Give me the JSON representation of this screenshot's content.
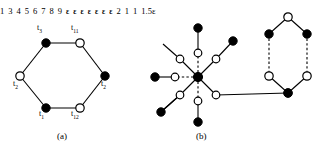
{
  "figure": {
    "panels": [
      {
        "id": "a",
        "caption": "(a)"
      },
      {
        "id": "b",
        "caption": "(b)"
      }
    ]
  },
  "panel_a": {
    "caption": "(a)",
    "description": "hexagon graph with alternating filled and open vertices, each labelled with a t-subscript token",
    "nodes": [
      {
        "name": "node-top-left",
        "fill": "filled",
        "label": "t",
        "sub": "3",
        "cx": 46,
        "cy": 43,
        "label_x": 38,
        "label_y": 29,
        "label_full": "t3"
      },
      {
        "name": "node-top-right",
        "fill": "open",
        "label": "t",
        "sub": "11",
        "cx": 80,
        "cy": 43,
        "label_x": 73,
        "label_y": 29,
        "label_full": "t11"
      },
      {
        "name": "node-right",
        "fill": "filled",
        "label": "t",
        "sub": "2",
        "cx": 105,
        "cy": 76,
        "label_x": 102,
        "label_y": 85,
        "label_full": "t2"
      },
      {
        "name": "node-bottom-right",
        "fill": "open",
        "label": "t",
        "sub": "12",
        "cx": 80,
        "cy": 108,
        "label_x": 73,
        "label_y": 113,
        "label_full": "t12"
      },
      {
        "name": "node-bottom-left",
        "fill": "filled",
        "label": "t",
        "sub": "1",
        "cx": 46,
        "cy": 108,
        "label_x": 40,
        "label_y": 113,
        "label_full": "t1"
      },
      {
        "name": "node-left",
        "fill": "open",
        "label": "t",
        "sub": "2",
        "cx": 20,
        "cy": 76,
        "label_x": 14,
        "label_y": 85,
        "label_full": "t2"
      }
    ],
    "edges": [
      [
        "node-top-left",
        "node-top-right"
      ],
      [
        "node-top-right",
        "node-right"
      ],
      [
        "node-right",
        "node-bottom-right"
      ],
      [
        "node-bottom-right",
        "node-bottom-left"
      ],
      [
        "node-bottom-left",
        "node-left"
      ],
      [
        "node-left",
        "node-top-left"
      ]
    ]
  },
  "panel_b": {
    "caption": "(b)",
    "description": "star hub graph with numbered spokes plus a hexagon with epsilon weights",
    "hub": {
      "name": "hub-node",
      "fill": "filled",
      "label": "1",
      "cx": 198,
      "cy": 77,
      "label_x": 203,
      "label_y": 72
    },
    "spokes": [
      {
        "name": "spoke-3",
        "label": "3",
        "open_cx": 216,
        "open_cy": 95,
        "label_x": 219,
        "label_y": 99,
        "line_style": "solid",
        "leaf": null
      },
      {
        "name": "spoke-4",
        "label": "4",
        "open_cx": 198,
        "open_cy": 101,
        "label_x": 202,
        "label_y": 104,
        "line_style": "dashed",
        "leaf": {
          "name": "leaf-eps-bottom",
          "cx": 198,
          "cy": 122,
          "eps_x": 188,
          "eps_y": 119,
          "eps": "ε"
        }
      },
      {
        "name": "spoke-5",
        "label": "5",
        "open_cx": 180,
        "open_cy": 95,
        "label_x": 176,
        "label_y": 104,
        "line_style": "solid",
        "leaf": {
          "name": "leaf-eps-lower-left",
          "cx": 161,
          "cy": 112,
          "eps_x": 152,
          "eps_y": 101,
          "eps": "ε"
        }
      },
      {
        "name": "spoke-6",
        "label": "6",
        "open_cx": 175,
        "open_cy": 77,
        "label_x": 172,
        "label_y": 88,
        "line_style": "dashed",
        "leaf": {
          "name": "leaf-eps-left",
          "cx": 155,
          "cy": 77,
          "eps_x": 146,
          "eps_y": 70,
          "eps": "ε"
        }
      },
      {
        "name": "spoke-7",
        "label": "7",
        "open_cx": 180,
        "open_cy": 59,
        "label_x": 172,
        "label_y": 50,
        "line_style": "solid",
        "leaf": null
      },
      {
        "name": "spoke-8",
        "label": "8",
        "open_cx": 198,
        "open_cy": 53,
        "label_x": 202,
        "label_y": 57,
        "line_style": "dashed",
        "leaf": {
          "name": "leaf-eps-top",
          "cx": 198,
          "cy": 28,
          "eps_x": 205,
          "eps_y": 26,
          "eps": "ε"
        }
      },
      {
        "name": "spoke-9",
        "label": "9",
        "open_cx": 216,
        "open_cy": 59,
        "label_x": 219,
        "label_y": 53,
        "line_style": "solid",
        "leaf": {
          "name": "leaf-eps-upper-right",
          "cx": 233,
          "cy": 41,
          "eps_x": 241,
          "eps_y": 36,
          "eps": "ε"
        }
      }
    ],
    "hexagon": {
      "name": "epsilon-hexagon",
      "top": {
        "name": "hex-node-top",
        "fill": "open",
        "cx": 288,
        "cy": 17
      },
      "upper_left": {
        "name": "hex-node-upper-left",
        "fill": "filled",
        "cx": 269,
        "cy": 34,
        "eps": "ε",
        "eps_x": 260,
        "eps_y": 26
      },
      "upper_right": {
        "name": "hex-node-upper-right",
        "fill": "filled",
        "cx": 307,
        "cy": 34,
        "eps": "ε",
        "eps_x": 310,
        "eps_y": 26
      },
      "lower_left": {
        "name": "hex-node-lower-left",
        "fill": "open",
        "cx": 269,
        "cy": 76
      },
      "lower_right": {
        "name": "hex-node-lower-right",
        "fill": "open",
        "cx": 307,
        "cy": 76
      },
      "bottom": {
        "name": "hex-node-bottom",
        "fill": "filled",
        "cx": 288,
        "cy": 93,
        "label": "1.5ε",
        "label_x": 276,
        "label_y": 97
      },
      "edge_labels": [
        {
          "name": "hex-edge-label-top",
          "text": "2",
          "x": 285,
          "y": 25
        },
        {
          "name": "hex-edge-label-left-side",
          "text": "1",
          "x": 263,
          "y": 56
        },
        {
          "name": "hex-edge-label-right-side",
          "text": "1",
          "x": 296,
          "y": 56
        }
      ]
    },
    "connector": {
      "name": "hub-to-hexagon-edge",
      "from_x": 216,
      "from_y": 95,
      "to_x": 288,
      "to_y": 93
    }
  },
  "colors": {
    "stroke": "#000000",
    "node_fill_filled": "#000000",
    "node_fill_open": "#ffffff",
    "background": "#ffffff"
  }
}
